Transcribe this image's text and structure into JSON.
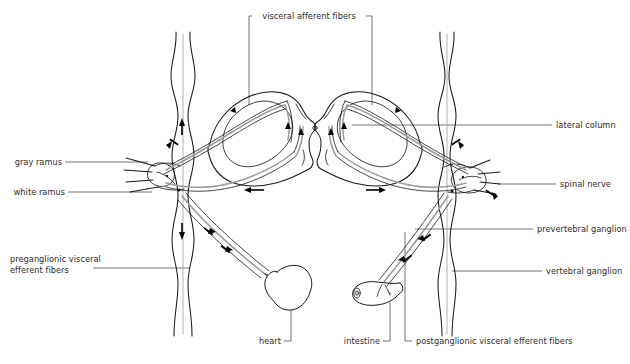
{
  "figure": {
    "width": 630,
    "height": 364,
    "background": "#ffffff",
    "line_color": "#1a1a1a",
    "fiber_color": "#9a9a9a",
    "label_color": "#2b2b2b"
  },
  "labels": {
    "top": {
      "visceral_afferent_fibers": "visceral afferent fibers"
    },
    "left": {
      "gray_ramus": "gray ramus",
      "white_ramus": "white ramus",
      "preganglionic_line1": "preganglionic visceral",
      "preganglionic_line2": "efferent fibers"
    },
    "right": {
      "lateral_column": "lateral column",
      "spinal_nerve": "spinal nerve",
      "prevertebral_ganglion": "prevertebral ganglion",
      "vertebral_ganglion": "vertebral ganglion"
    },
    "bottom": {
      "heart": "heart",
      "intestine": "intestine",
      "postganglionic": "postganglionic visceral efferent fibers"
    }
  },
  "structures": [
    {
      "name": "spinal-cord-gray-matter",
      "description": "butterfly shaped central gray matter"
    },
    {
      "name": "central-canal",
      "description": "small central opening"
    },
    {
      "name": "sympathetic-chain-left",
      "description": "vertical vertebral ganglion chain, left"
    },
    {
      "name": "sympathetic-chain-right",
      "description": "vertical vertebral ganglion chain, right"
    },
    {
      "name": "heart-organ",
      "description": "rounded heart outline"
    },
    {
      "name": "intestine-organ",
      "description": "tubular intestine segment"
    }
  ]
}
